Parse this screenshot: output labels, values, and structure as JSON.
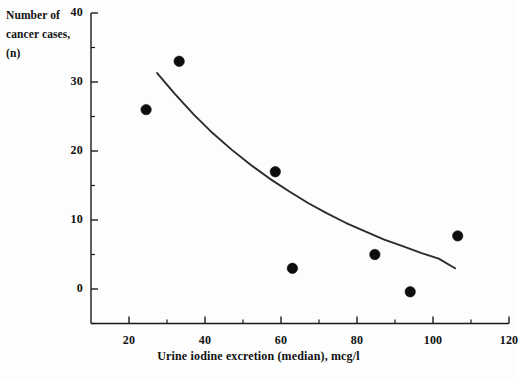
{
  "chart_data": {
    "type": "scatter",
    "title": "",
    "xlabel": "Urine iodine excretion (median), mcg/l",
    "ylabel": "Number of cancer cases, (n)",
    "ylabel_lines": [
      "Number of",
      "cancer cases,",
      "(n)"
    ],
    "xlim": [
      10,
      120
    ],
    "ylim": [
      -5,
      40
    ],
    "grid": false,
    "legend": false,
    "x_ticks": [
      20,
      40,
      60,
      80,
      100,
      120
    ],
    "x_tick_labels": [
      "20",
      "40",
      "60",
      "80",
      "100",
      "120"
    ],
    "x_minor_ticks": [
      30,
      50,
      70,
      90,
      110
    ],
    "y_ticks": [
      0,
      10,
      20,
      30,
      40
    ],
    "y_tick_labels": [
      "0",
      "10",
      "20",
      "30",
      "40"
    ],
    "y_minor_ticks": [
      -5,
      5,
      15,
      25,
      35
    ],
    "series": [
      {
        "name": "Cancer cases vs urine iodine",
        "marker": "filled-circle",
        "color": "#0d0d0d",
        "points": [
          {
            "x": 24.5,
            "y": 26.0
          },
          {
            "x": 33.2,
            "y": 33.0
          },
          {
            "x": 58.5,
            "y": 17.0
          },
          {
            "x": 63.0,
            "y": 3.0
          },
          {
            "x": 84.7,
            "y": 5.0
          },
          {
            "x": 94.0,
            "y": -0.4
          },
          {
            "x": 106.5,
            "y": 7.7
          }
        ]
      }
    ],
    "fit_curve": {
      "name": "exponential trend line",
      "color": "#2b2b2b",
      "points": [
        {
          "x": 27.4,
          "y": 31.3
        },
        {
          "x": 32.0,
          "y": 28.3
        },
        {
          "x": 37.0,
          "y": 25.3
        },
        {
          "x": 42.0,
          "y": 22.6
        },
        {
          "x": 47.0,
          "y": 20.2
        },
        {
          "x": 52.0,
          "y": 18.0
        },
        {
          "x": 57.0,
          "y": 16.0
        },
        {
          "x": 62.0,
          "y": 14.2
        },
        {
          "x": 67.0,
          "y": 12.5
        },
        {
          "x": 72.0,
          "y": 11.0
        },
        {
          "x": 77.0,
          "y": 9.6
        },
        {
          "x": 82.0,
          "y": 8.4
        },
        {
          "x": 87.0,
          "y": 7.2
        },
        {
          "x": 92.0,
          "y": 6.2
        },
        {
          "x": 97.0,
          "y": 5.2
        },
        {
          "x": 101.5,
          "y": 4.4
        },
        {
          "x": 105.8,
          "y": 3.0
        }
      ]
    }
  },
  "axis_label_y": "Number of cancer cases, (n)",
  "axis_label_x": "Urine iodine excretion (median), mcg/l"
}
